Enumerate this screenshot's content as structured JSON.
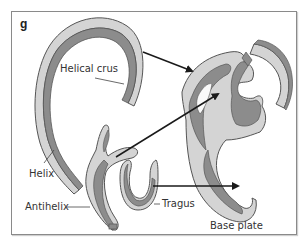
{
  "figure": {
    "panel_letter": "g",
    "labels": {
      "helical_crus": "Helical crus",
      "helix": "Helix",
      "antihelix": "Antihelix",
      "tragus": "Tragus",
      "base_plate": "Base plate"
    },
    "colors": {
      "light_fill": "#d4d4d4",
      "dark_fill": "#8c8c8c",
      "outline": "#555555",
      "arrow": "#1a1a1a",
      "frame": "#8a8a8a"
    }
  }
}
